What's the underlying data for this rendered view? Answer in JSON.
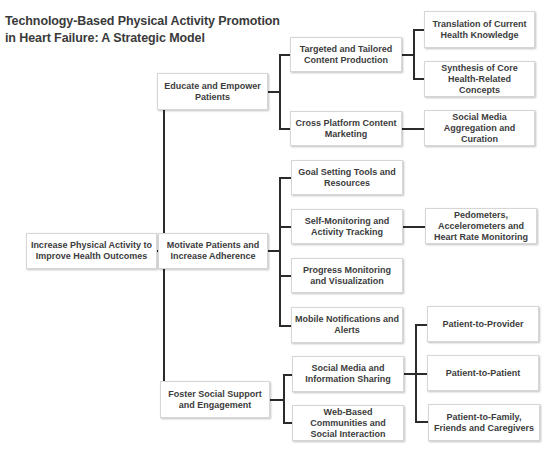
{
  "title": {
    "line1": "Technology-Based Physical Activity Promotion",
    "line2": "in Heart Failure: A Strategic Model"
  },
  "root": {
    "label": "Increase Physical Activity to Improve Health Outcomes"
  },
  "branches": [
    {
      "label": "Educate and Empower Patients",
      "children": [
        {
          "label": "Targeted and Tailored Content Production",
          "children": [
            {
              "label": "Translation of Current Health Knowledge"
            },
            {
              "label": "Synthesis of Core Health-Related Concepts"
            }
          ]
        },
        {
          "label": "Cross Platform Content Marketing",
          "children": [
            {
              "label": "Social Media Aggregation and Curation"
            }
          ]
        }
      ]
    },
    {
      "label": "Motivate Patients and Increase Adherence",
      "children": [
        {
          "label": "Goal Setting Tools and Resources"
        },
        {
          "label": "Self-Monitoring and Activity Tracking",
          "children": [
            {
              "label": "Pedometers, Accelerometers and Heart Rate Monitoring"
            }
          ]
        },
        {
          "label": "Progress Monitoring and Visualization"
        },
        {
          "label": "Mobile Notifications and Alerts"
        }
      ]
    },
    {
      "label": "Foster Social Support and Engagement",
      "children": [
        {
          "label": "Social Media and Information Sharing",
          "children": [
            {
              "label": "Patient-to-Provider"
            },
            {
              "label": "Patient-to-Patient"
            },
            {
              "label": "Patient-to-Family, Friends and Caregivers"
            }
          ]
        },
        {
          "label": "Web-Based Communities and Social Interaction"
        }
      ]
    }
  ]
}
